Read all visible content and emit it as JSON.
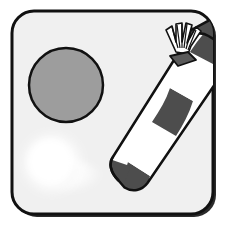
{
  "scene": {
    "title": "Party blower illustration",
    "canvas": {
      "width": 229,
      "height": 226
    },
    "outer_background": "#ffffff"
  },
  "frame": {
    "name": "rounded-square-frame",
    "fill": "#f0f0f0",
    "stroke": "#111111",
    "stroke_width": 3,
    "corner_radius": 22,
    "x": 12,
    "y": 11,
    "width": 201,
    "height": 203,
    "shadow_color": "#2b2b2b",
    "shadow_offset_x": 3,
    "shadow_offset_y": 3
  },
  "circle": {
    "name": "gray-circle",
    "label": "Gray disc",
    "fill": "#9d9d9d",
    "stroke": "#111111",
    "stroke_width": 2.5,
    "center_x": 66,
    "center_y": 85,
    "radius": 37
  },
  "glow": {
    "name": "white-glow-swirl",
    "label": "Soft white glow swirl",
    "color": "#ffffff",
    "center_x": 52,
    "center_y": 163,
    "radius": 33,
    "tail_length": 58
  },
  "blower": {
    "name": "striped-party-blower",
    "label": "Striped party blower",
    "tip_x": 117,
    "tip_y": 169,
    "crimp_x": 196,
    "crimp_y": 38,
    "width": 26,
    "stroke": "#111111",
    "stroke_width": 2.5,
    "light_stripe_color": "#ffffff",
    "dark_stripe_color": "#4d4d4d",
    "stripe_count": 5,
    "crimp": {
      "name": "crimped-fan-end",
      "label": "Crimped fan end",
      "pleat_count": 7,
      "fill": "#ffffff",
      "shade": "#5a5a5a"
    },
    "handle": {
      "name": "blower-handle",
      "label": "Dark handle segment",
      "fill": "#4d4d4d"
    }
  },
  "a11y": {
    "description": "A rounded square frame containing a gray circle, a diagonal striped party blower with a crimped fan end, and a soft white glow in the lower left."
  }
}
